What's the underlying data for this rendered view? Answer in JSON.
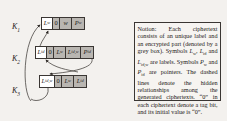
{
  "figure": {
    "colors": {
      "encrypted_box_grey": "#b9b6b1",
      "line": "#3a3633",
      "text": "#1d1a18",
      "page_background": "#f3f1ee",
      "notion_background": "#f6f4f1"
    }
  },
  "diagram": {
    "keys": [
      {
        "label": "K",
        "subscript": "1"
      },
      {
        "label": "K",
        "subscript": "2"
      },
      {
        "label": "K",
        "subscript": "3"
      }
    ],
    "rows": [
      {
        "name": "ciphertext-row-1",
        "cells": [
          {
            "type": "label",
            "text": "L",
            "subscript": "w",
            "shaded": false
          },
          {
            "type": "tag",
            "text": "0",
            "shaded": true
          },
          {
            "type": "encrypted",
            "text": "w",
            "shaded": true
          },
          {
            "type": "encrypted",
            "text": "P",
            "subscript": "w",
            "shaded": true
          }
        ]
      },
      {
        "name": "ciphertext-row-2",
        "cells": [
          {
            "type": "label",
            "text": "L",
            "subscript": "id",
            "shaded": false
          },
          {
            "type": "tag",
            "text": "0",
            "shaded": true
          },
          {
            "type": "encrypted",
            "text": "L",
            "subscript": "w",
            "shaded": true
          },
          {
            "type": "encrypted",
            "text": "L",
            "subscript": "id,w",
            "shaded": true
          },
          {
            "type": "encrypted",
            "text": "P",
            "subscript": "id",
            "shaded": true
          }
        ]
      },
      {
        "name": "ciphertext-row-3",
        "cells": [
          {
            "type": "label",
            "text": "L",
            "subscript": "id,w",
            "shaded": false
          },
          {
            "type": "tag",
            "text": "0",
            "shaded": true
          },
          {
            "type": "encrypted",
            "text": "L",
            "subscript": "w",
            "shaded": true
          },
          {
            "type": "encrypted",
            "text": "L",
            "subscript": "id",
            "shaded": true
          }
        ]
      }
    ],
    "separator": "‖"
  },
  "notion": {
    "heading": "Notion:",
    "body": "Each ciphertext consists of an unique label and an encrypted part (denoted by a grey box). Symbols L",
    "full_text": "Notion: Each ciphertext consists of an unique label and an encrypted part (denoted by a grey box). Symbols Lw, Lid and Lid,w are labels. Symbols Pw and Pid are pointers. The dashed lines denote the hidden relationships among the generated ciphertexts. “0” in each ciphertext denote a tag bit, and its initial value is “0”.",
    "symbols_labels": [
      "L w",
      "L id",
      "L id,w"
    ],
    "symbols_pointers": [
      "P w",
      "P id"
    ],
    "tag_bit_value": "0"
  }
}
